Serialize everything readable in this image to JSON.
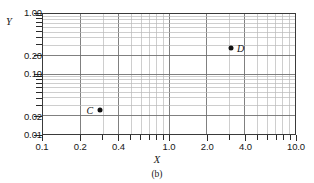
{
  "figure": {
    "caption": "(b)",
    "x_axis_title": "X",
    "y_axis_title": "Y"
  },
  "chart_data": {
    "type": "scatter",
    "title": "",
    "subtitle": "",
    "caption": "(b)",
    "xlabel": "X",
    "ylabel": "Y",
    "xscale": "log",
    "yscale": "log",
    "xlim": [
      0.1,
      10.0
    ],
    "ylim": [
      0.01,
      1.0
    ],
    "grid": true,
    "legend": null,
    "x_ticks": [
      {
        "value": 0.1,
        "label": "0.1",
        "major": true
      },
      {
        "value": 0.2,
        "label": "0.2",
        "major": true
      },
      {
        "value": 0.3,
        "label": "",
        "major": false
      },
      {
        "value": 0.4,
        "label": "0.4",
        "major": true
      },
      {
        "value": 0.5,
        "label": "",
        "major": false
      },
      {
        "value": 0.6,
        "label": "",
        "major": false
      },
      {
        "value": 0.7,
        "label": "",
        "major": false
      },
      {
        "value": 0.8,
        "label": "",
        "major": false
      },
      {
        "value": 0.9,
        "label": "",
        "major": false
      },
      {
        "value": 1.0,
        "label": "1.0",
        "major": true
      },
      {
        "value": 2.0,
        "label": "2.0",
        "major": true
      },
      {
        "value": 3.0,
        "label": "",
        "major": false
      },
      {
        "value": 4.0,
        "label": "4.0",
        "major": true
      },
      {
        "value": 5.0,
        "label": "",
        "major": false
      },
      {
        "value": 6.0,
        "label": "",
        "major": false
      },
      {
        "value": 7.0,
        "label": "",
        "major": false
      },
      {
        "value": 8.0,
        "label": "",
        "major": false
      },
      {
        "value": 9.0,
        "label": "",
        "major": false
      },
      {
        "value": 10.0,
        "label": "10.0",
        "major": true
      }
    ],
    "y_ticks": [
      {
        "value": 0.01,
        "label": "0.01",
        "major": true
      },
      {
        "value": 0.02,
        "label": "0.02",
        "major": true
      },
      {
        "value": 0.03,
        "label": "",
        "major": false
      },
      {
        "value": 0.04,
        "label": "",
        "major": false
      },
      {
        "value": 0.05,
        "label": "",
        "major": false
      },
      {
        "value": 0.06,
        "label": "",
        "major": false
      },
      {
        "value": 0.07,
        "label": "",
        "major": false
      },
      {
        "value": 0.08,
        "label": "",
        "major": false
      },
      {
        "value": 0.09,
        "label": "",
        "major": false
      },
      {
        "value": 0.1,
        "label": "0.10",
        "major": true
      },
      {
        "value": 0.2,
        "label": "0.20",
        "major": true
      },
      {
        "value": 0.3,
        "label": "",
        "major": false
      },
      {
        "value": 0.4,
        "label": "",
        "major": false
      },
      {
        "value": 0.5,
        "label": "",
        "major": false
      },
      {
        "value": 0.6,
        "label": "",
        "major": false
      },
      {
        "value": 0.7,
        "label": "",
        "major": false
      },
      {
        "value": 0.8,
        "label": "",
        "major": false
      },
      {
        "value": 0.9,
        "label": "",
        "major": false
      },
      {
        "value": 1.0,
        "label": "1.00",
        "major": true
      }
    ],
    "points": [
      {
        "label": "C",
        "x": 0.28,
        "y": 0.027,
        "label_side": "left"
      },
      {
        "label": "D",
        "x": 3.0,
        "y": 0.28,
        "label_side": "right"
      }
    ]
  },
  "colors": {
    "axis": "#3a3a3a",
    "grid_major": "#707070",
    "grid_minor": "#b8b8b8",
    "marker": "#111111",
    "text": "#171717",
    "background": "#ffffff"
  }
}
